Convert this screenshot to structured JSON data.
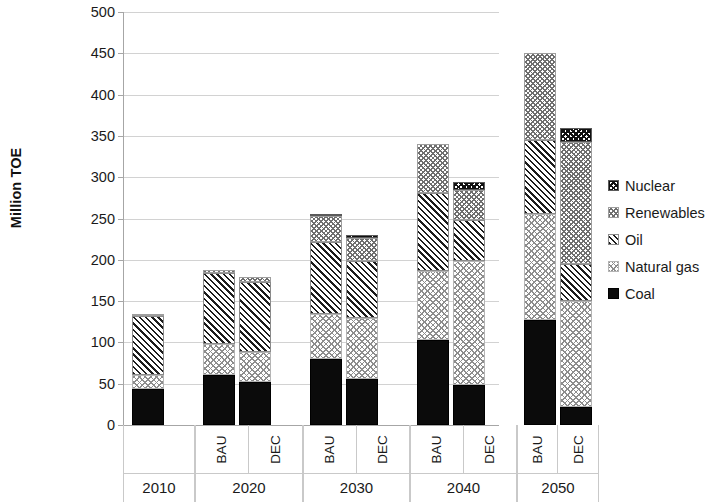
{
  "chart_data": {
    "type": "bar",
    "stacked": true,
    "title": "",
    "xlabel": "",
    "ylabel": "Million TOE",
    "ylim": [
      0,
      500
    ],
    "ytick_step": 50,
    "yticks": [
      0,
      50,
      100,
      150,
      200,
      250,
      300,
      350,
      400,
      450,
      500
    ],
    "grid": true,
    "legend_position": "right",
    "categories": [
      "2010",
      "2020 BAU",
      "2020 DEC",
      "2030 BAU",
      "2030 DEC",
      "2040 BAU",
      "2040 DEC",
      "2050 BAU",
      "2050 DEC"
    ],
    "series": [
      {
        "name": "Coal",
        "pattern": "solid-black",
        "values": [
          43,
          60,
          52,
          80,
          56,
          103,
          48,
          127,
          22
        ]
      },
      {
        "name": "Natural gas",
        "pattern": "light-cross",
        "values": [
          17,
          38,
          36,
          55,
          74,
          83,
          150,
          128,
          128
        ]
      },
      {
        "name": "Oil",
        "pattern": "diagonal",
        "values": [
          72,
          86,
          85,
          87,
          69,
          95,
          50,
          90,
          45
        ]
      },
      {
        "name": "Renewables",
        "pattern": "medium-cross",
        "values": [
          3,
          4,
          6,
          31,
          28,
          59,
          37,
          105,
          148
        ]
      },
      {
        "name": "Nuclear",
        "pattern": "dense-cross",
        "values": [
          0,
          0,
          0,
          1,
          3,
          0,
          9,
          0,
          17
        ]
      }
    ],
    "totals": [
      135,
      188,
      179,
      254,
      230,
      340,
      294,
      450,
      360
    ],
    "groups": [
      {
        "year": "2010",
        "scenarios": [
          ""
        ]
      },
      {
        "year": "2020",
        "scenarios": [
          "BAU",
          "DEC"
        ]
      },
      {
        "year": "2030",
        "scenarios": [
          "BAU",
          "DEC"
        ]
      },
      {
        "year": "2040",
        "scenarios": [
          "BAU",
          "DEC"
        ]
      },
      {
        "year": "2050",
        "scenarios": [
          "BAU",
          "DEC"
        ]
      }
    ]
  },
  "legend": {
    "items": [
      {
        "label": "Nuclear",
        "swatch": "dense-cross-icon"
      },
      {
        "label": "Renewables",
        "swatch": "medium-cross-icon"
      },
      {
        "label": "Oil",
        "swatch": "diagonal-stripe-icon"
      },
      {
        "label": "Natural gas",
        "swatch": "light-cross-icon"
      },
      {
        "label": "Coal",
        "swatch": "solid-black-icon"
      }
    ]
  },
  "colors": {
    "axis": "#a6a6a6",
    "gridline": "#d2d2d2",
    "text": "#1a1a1a",
    "coal": "#0b0b0b",
    "background": "#ffffff"
  }
}
